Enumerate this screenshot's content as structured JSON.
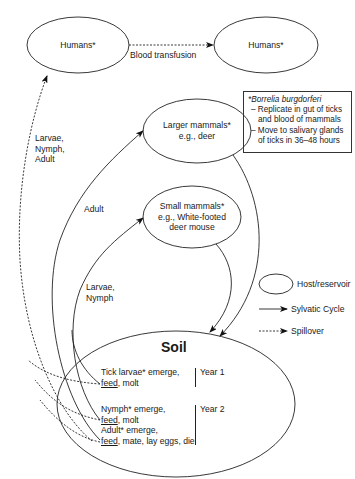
{
  "diagram": {
    "nodes": {
      "humans_left": {
        "label": "Humans*"
      },
      "humans_right": {
        "label": "Humans*"
      },
      "larger_mammals": {
        "line1": "Larger mammals*",
        "line2": "e.g., deer"
      },
      "small_mammals": {
        "line1": "Small mammals*",
        "line2": "e.g., White-footed",
        "line3": "deer mouse"
      },
      "soil": {
        "title": "Soil",
        "stages": [
          {
            "line1": "Tick larvae* emerge,",
            "feed": "feed",
            "rest": ", molt"
          },
          {
            "line1": "Nymph* emerge,",
            "feed": "feed",
            "rest": ", molt"
          },
          {
            "line1": "Adult* emerge,",
            "feed": "feed",
            "rest": ", mate, lay eggs, die"
          }
        ],
        "years": [
          "Year 1",
          "Year 2"
        ]
      }
    },
    "edges": {
      "blood_transfusion": "Blood transfusion",
      "to_humans": {
        "line1": "Larvae,",
        "line2": "Nymph,",
        "line3": "Adult"
      },
      "to_larger_mammals": "Adult",
      "to_small_mammals": {
        "line1": "Larvae,",
        "line2": "Nymph"
      }
    },
    "note": {
      "title": "*Borrelia burgdorferi",
      "items": [
        "– Replicate in gut of ticks and blood of mammals",
        "– Move to salivary glands of ticks in 36–48 hours"
      ]
    },
    "legend": {
      "host": "Host/reservoir",
      "sylvatic": "Sylvatic Cycle",
      "spillover": "Spillover"
    }
  }
}
